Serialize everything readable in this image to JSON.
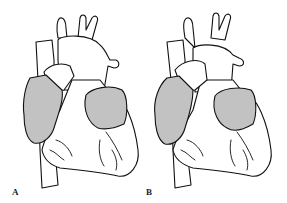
{
  "figure": {
    "panels": [
      {
        "label": "A",
        "description": "Heart outline with shaded right atrium and shaded left atrial appendage region"
      },
      {
        "label": "B",
        "description": "Heart outline with shaded right atrium and shaded left atrial appendage region, variant"
      }
    ],
    "colors": {
      "outline": "#111111",
      "shading": "#c2c2c2",
      "background": "#ffffff"
    }
  }
}
